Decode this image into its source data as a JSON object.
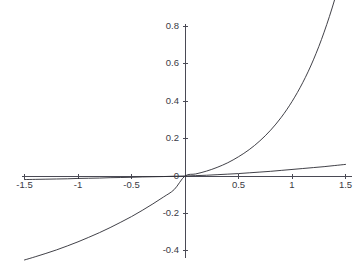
{
  "chart_data": {
    "type": "line",
    "title": "",
    "subtitle": "",
    "xlabel": "",
    "ylabel": "",
    "xlim": [
      -1.58,
      1.58
    ],
    "ylim": [
      -0.5,
      0.88
    ],
    "grid": false,
    "legend": "none",
    "background_color": "#ffffff",
    "axis_color": "#4a4a55",
    "curve_color": "#2b2b33",
    "xticks": [
      -1.5,
      -1,
      -0.5,
      0.5,
      1,
      1.5
    ],
    "xtick_labels": [
      "-1.5",
      "-1",
      "-0.5",
      "0.5",
      "1",
      "1.5"
    ],
    "yticks": [
      0.8,
      0.6,
      0.4,
      0.2,
      0,
      -0.2,
      -0.4
    ],
    "ytick_labels": [
      "0.8",
      "0.6",
      "0.4",
      "0.2",
      "0",
      "-0.2",
      "-0.4"
    ],
    "origin_label": "0",
    "series": [
      {
        "name": "steep-curve",
        "x": [
          -1.5,
          -1.4,
          -1.3,
          -1.2,
          -1.1,
          -1.0,
          -0.9,
          -0.8,
          -0.7,
          -0.6,
          -0.5,
          -0.4,
          -0.3,
          -0.2,
          -0.1,
          0.0,
          0.1,
          0.2,
          0.3,
          0.4,
          0.5,
          0.6,
          0.7,
          0.8,
          0.9,
          1.0,
          1.1,
          1.2,
          1.3,
          1.4,
          1.5
        ],
        "values": [
          -0.449,
          -0.432,
          -0.414,
          -0.395,
          -0.374,
          -0.352,
          -0.328,
          -0.303,
          -0.276,
          -0.247,
          -0.217,
          -0.184,
          -0.149,
          -0.112,
          -0.072,
          0.0,
          0.011,
          0.026,
          0.046,
          0.071,
          0.103,
          0.141,
          0.188,
          0.245,
          0.314,
          0.398,
          0.499,
          0.621,
          0.769,
          0.946,
          1.16
        ]
      },
      {
        "name": "shallow-curve",
        "x": [
          -1.5,
          -1.4,
          -1.3,
          -1.2,
          -1.1,
          -1.0,
          -0.9,
          -0.8,
          -0.7,
          -0.6,
          -0.5,
          -0.4,
          -0.3,
          -0.2,
          -0.1,
          0.0,
          0.1,
          0.2,
          0.3,
          0.4,
          0.5,
          0.6,
          0.7,
          0.8,
          0.9,
          1.0,
          1.1,
          1.2,
          1.3,
          1.4,
          1.5
        ],
        "values": [
          -0.019,
          -0.018,
          -0.017,
          -0.016,
          -0.015,
          -0.013,
          -0.012,
          -0.011,
          -0.009,
          -0.008,
          -0.007,
          -0.005,
          -0.004,
          -0.003,
          -0.001,
          0.0,
          0.002,
          0.004,
          0.007,
          0.01,
          0.013,
          0.017,
          0.021,
          0.025,
          0.03,
          0.035,
          0.04,
          0.045,
          0.05,
          0.056,
          0.062
        ]
      }
    ]
  }
}
